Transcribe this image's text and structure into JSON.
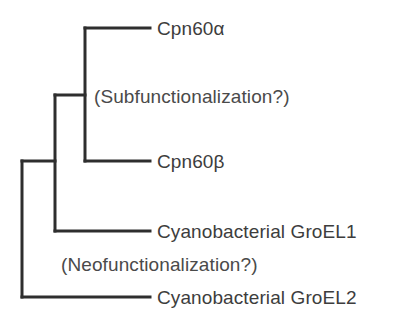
{
  "figure": {
    "type": "cladogram",
    "stroke_color": "#2e2e2e",
    "text_color": "#3d3d3d",
    "background_color": "#ffffff",
    "stroke_width": 3
  },
  "taxa": [
    {
      "id": "cpn60a",
      "label": "Cpn60α",
      "tip_x": 150,
      "y": 28
    },
    {
      "id": "cpn60b",
      "label": "Cpn60β",
      "tip_x": 150,
      "y": 161
    },
    {
      "id": "groel1",
      "label": "Cyanobacterial GroEL1",
      "tip_x": 150,
      "y": 231
    },
    {
      "id": "groel2",
      "label": "Cyanobacterial GroEL2",
      "tip_x": 150,
      "y": 297
    }
  ],
  "nodes": [
    {
      "id": "root",
      "x": 22,
      "y_top": 161,
      "y_bottom": 297
    },
    {
      "id": "inner-clade",
      "x": 55,
      "y_top": 95,
      "y_bottom": 231
    },
    {
      "id": "cpn60-clade",
      "x": 85,
      "y_top": 28,
      "y_bottom": 161
    }
  ],
  "annotations": [
    {
      "id": "subfunctionalization",
      "text": "(Subfunctionalization?)"
    },
    {
      "id": "neofunctionalization",
      "text": "(Neofunctionalization?)"
    }
  ]
}
